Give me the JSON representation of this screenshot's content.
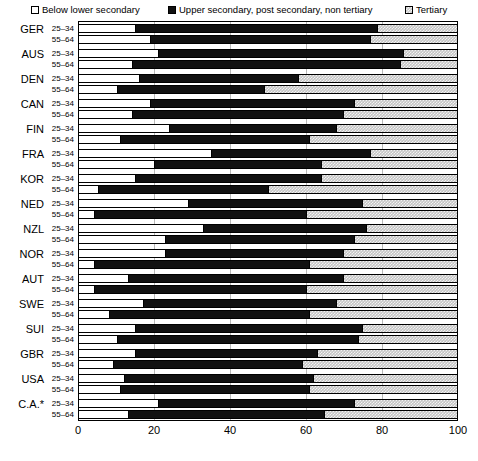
{
  "legend": {
    "items": [
      {
        "label": "Below lower secondary",
        "icon": "square-outline-white-icon",
        "color": "#ffffff"
      },
      {
        "label": "Upper secondary, post secondary, non tertiary",
        "icon": "square-filled-black-icon",
        "color": "#111111"
      },
      {
        "label": "Tertiary",
        "icon": "square-hatched-grey-icon",
        "color": "#c4c4c4"
      }
    ]
  },
  "axis": {
    "ticks": [
      "0",
      "20",
      "40",
      "60",
      "80",
      "100"
    ],
    "min": 0,
    "max": 100
  },
  "footnote": "",
  "chart_data": {
    "type": "bar",
    "orientation": "horizontal",
    "stacked": true,
    "title": "",
    "xlabel": "",
    "ylabel": "",
    "xlim": [
      0,
      100
    ],
    "grid": true,
    "legend_position": "top",
    "series": [
      {
        "name": "Below lower secondary",
        "color": "#ffffff"
      },
      {
        "name": "Upper secondary, post secondary, non tertiary",
        "color": "#111111"
      },
      {
        "name": "Tertiary",
        "color": "#c4c4c4"
      }
    ],
    "age_groups": [
      "25–34",
      "55–64"
    ],
    "categories": [
      "GER",
      "AUS",
      "DEN",
      "CAN",
      "FIN",
      "FRA",
      "KOR",
      "NED",
      "NZL",
      "NOR",
      "AUT",
      "SWE",
      "SUI",
      "GBR",
      "USA",
      "C.A.*"
    ],
    "rows": [
      {
        "country": "GER",
        "age": "25–34",
        "below": 15,
        "upper": 64,
        "tertiary": 21
      },
      {
        "country": "GER",
        "age": "55–64",
        "below": 19,
        "upper": 58,
        "tertiary": 23
      },
      {
        "country": "AUS",
        "age": "25–34",
        "below": 21,
        "upper": 65,
        "tertiary": 14
      },
      {
        "country": "AUS",
        "age": "55–64",
        "below": 14,
        "upper": 71,
        "tertiary": 15
      },
      {
        "country": "DEN",
        "age": "25–34",
        "below": 16,
        "upper": 42,
        "tertiary": 42
      },
      {
        "country": "DEN",
        "age": "55–64",
        "below": 10,
        "upper": 39,
        "tertiary": 51
      },
      {
        "country": "CAN",
        "age": "25–34",
        "below": 19,
        "upper": 54,
        "tertiary": 27
      },
      {
        "country": "CAN",
        "age": "55–64",
        "below": 14,
        "upper": 56,
        "tertiary": 30
      },
      {
        "country": "FIN",
        "age": "25–34",
        "below": 24,
        "upper": 44,
        "tertiary": 32
      },
      {
        "country": "FIN",
        "age": "55–64",
        "below": 11,
        "upper": 50,
        "tertiary": 39
      },
      {
        "country": "FRA",
        "age": "25–34",
        "below": 35,
        "upper": 42,
        "tertiary": 23
      },
      {
        "country": "FRA",
        "age": "55–64",
        "below": 20,
        "upper": 44,
        "tertiary": 36
      },
      {
        "country": "KOR",
        "age": "25–34",
        "below": 15,
        "upper": 49,
        "tertiary": 36
      },
      {
        "country": "KOR",
        "age": "55–64",
        "below": 5,
        "upper": 45,
        "tertiary": 50
      },
      {
        "country": "NED",
        "age": "25–34",
        "below": 29,
        "upper": 46,
        "tertiary": 25
      },
      {
        "country": "NED",
        "age": "55–64",
        "below": 4,
        "upper": 56,
        "tertiary": 40
      },
      {
        "country": "NZL",
        "age": "25–34",
        "below": 33,
        "upper": 43,
        "tertiary": 24
      },
      {
        "country": "NZL",
        "age": "55–64",
        "below": 23,
        "upper": 50,
        "tertiary": 27
      },
      {
        "country": "NOR",
        "age": "25–34",
        "below": 23,
        "upper": 47,
        "tertiary": 30
      },
      {
        "country": "NOR",
        "age": "55–64",
        "below": 4,
        "upper": 57,
        "tertiary": 39
      },
      {
        "country": "AUT",
        "age": "25–34",
        "below": 13,
        "upper": 57,
        "tertiary": 30
      },
      {
        "country": "AUT",
        "age": "55–64",
        "below": 4,
        "upper": 56,
        "tertiary": 40
      },
      {
        "country": "SWE",
        "age": "25–34",
        "below": 17,
        "upper": 51,
        "tertiary": 32
      },
      {
        "country": "SWE",
        "age": "55–64",
        "below": 8,
        "upper": 53,
        "tertiary": 39
      },
      {
        "country": "SUI",
        "age": "25–34",
        "below": 15,
        "upper": 60,
        "tertiary": 25
      },
      {
        "country": "SUI",
        "age": "55–64",
        "below": 10,
        "upper": 64,
        "tertiary": 26
      },
      {
        "country": "GBR",
        "age": "25–34",
        "below": 15,
        "upper": 48,
        "tertiary": 37
      },
      {
        "country": "GBR",
        "age": "55–64",
        "below": 9,
        "upper": 50,
        "tertiary": 41
      },
      {
        "country": "USA",
        "age": "25–34",
        "below": 12,
        "upper": 50,
        "tertiary": 38
      },
      {
        "country": "USA",
        "age": "55–64",
        "below": 11,
        "upper": 50,
        "tertiary": 39
      },
      {
        "country": "C.A.*",
        "age": "25–34",
        "below": 21,
        "upper": 52,
        "tertiary": 27
      },
      {
        "country": "C.A.*",
        "age": "55–64",
        "below": 13,
        "upper": 52,
        "tertiary": 35
      }
    ]
  }
}
